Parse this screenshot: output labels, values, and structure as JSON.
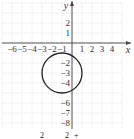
{
  "chart_data": {
    "type": "scatter",
    "title": "",
    "xlabel": "x",
    "ylabel": "y",
    "xlim": [
      -7,
      5
    ],
    "ylim": [
      -8.5,
      4
    ],
    "grid": true,
    "x_tick_labels": [
      "-6",
      "-5",
      "-4",
      "-3",
      "-2",
      "-1",
      "1",
      "2",
      "3",
      "4"
    ],
    "y_tick_labels": [
      "2",
      "1",
      "-2",
      "-3",
      "-4",
      "-6",
      "-7",
      "-8"
    ],
    "shapes": [
      {
        "kind": "circle",
        "center": [
          -1,
          -3
        ],
        "radius": 2,
        "color": "#222222"
      }
    ],
    "colors": {
      "grid": "#cfcfcf",
      "axes": "#444444",
      "curve": "#222222"
    }
  },
  "caption": {
    "partial_text": "2 ... 2 ..."
  }
}
